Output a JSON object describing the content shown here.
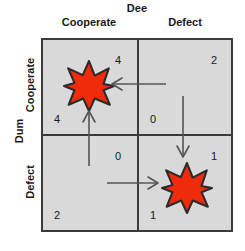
{
  "diagram": {
    "type": "payoff-matrix",
    "title_row_player": "Dum",
    "title_col_player": "Dee",
    "strategies": [
      "Cooperate",
      "Defect"
    ],
    "cells": [
      {
        "row": "Cooperate",
        "col": "Cooperate",
        "col_payoff": "4",
        "row_payoff": "4",
        "has_star": true
      },
      {
        "row": "Cooperate",
        "col": "Defect",
        "col_payoff": "2",
        "row_payoff": "0",
        "has_star": false
      },
      {
        "row": "Defect",
        "col": "Cooperate",
        "col_payoff": "0",
        "row_payoff": "2",
        "has_star": false
      },
      {
        "row": "Defect",
        "col": "Defect",
        "col_payoff": "1",
        "row_payoff": "1",
        "has_star": true
      }
    ],
    "arrows": [
      {
        "name": "arrow-left-top-row",
        "direction": "left"
      },
      {
        "name": "arrow-down-right-col",
        "direction": "down"
      },
      {
        "name": "arrow-up-left-col",
        "direction": "up"
      },
      {
        "name": "arrow-right-bottom-row",
        "direction": "right"
      }
    ],
    "colors": {
      "star_fill": "#ef2b0c",
      "star_stroke": "#2b2b2b",
      "grid_fill": "#d9d9d9",
      "grid_border": "#3b3b3b",
      "arrow": "#555555",
      "text": "#1a1a1a",
      "page_background": "#ffffff"
    }
  }
}
